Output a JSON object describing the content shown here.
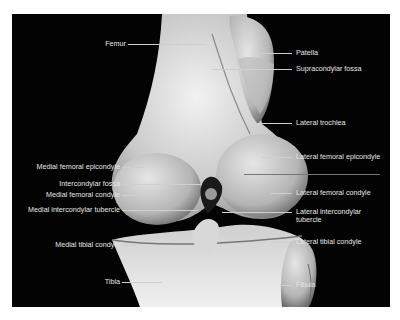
{
  "figure": {
    "background": "#030303",
    "bone_color": "#d9d9d9",
    "labels_left": [
      {
        "text": "Femur",
        "y": 44
      },
      {
        "text": "Medial femoral epicondyle",
        "y": 167
      },
      {
        "text": "Intercondylar fossa",
        "y": 184
      },
      {
        "text": "Medial femoral condyle",
        "y": 195
      },
      {
        "text": "Medial intercondylar tubercle",
        "y": 210
      },
      {
        "text": "Medial tibial condyle",
        "y": 245
      },
      {
        "text": "Tibia",
        "y": 282
      }
    ],
    "labels_right": [
      {
        "text": "Patella",
        "y": 53
      },
      {
        "text": "Supracondylar fossa",
        "y": 69
      },
      {
        "text": "Lateral trochlea",
        "y": 123
      },
      {
        "text": "Lateral femoral epicondyle",
        "y": 157
      },
      {
        "text": "Lateral femoral condyle",
        "y": 193
      },
      {
        "text": "Lateral intercondylar",
        "text2": "tubercle",
        "y": 212
      },
      {
        "text": "Lateral tibial condyle",
        "y": 242
      },
      {
        "text": "Fibula",
        "y": 285
      }
    ]
  }
}
